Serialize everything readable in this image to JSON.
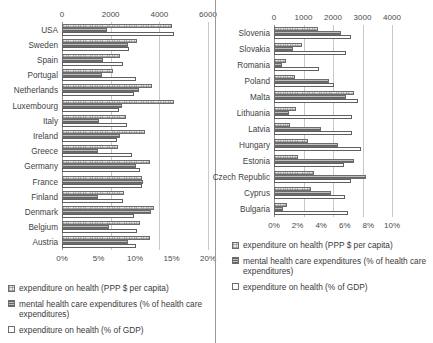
{
  "chart_data": [
    {
      "id": "western",
      "type": "bar",
      "orientation": "horizontal",
      "title": "",
      "grid": true,
      "legend_position": "bottom",
      "top_axis": {
        "label": "expenditure on health (PPP $ per capita)",
        "ticks": [
          "0",
          "2000",
          "4000",
          "6000"
        ],
        "values": [
          0,
          2000,
          4000,
          6000
        ],
        "lim": [
          0,
          6000
        ]
      },
      "bottom_axis": {
        "label": "percent",
        "ticks": [
          "0%",
          "5%",
          "10%",
          "15%",
          "20%"
        ],
        "values": [
          0,
          5,
          10,
          15,
          20
        ],
        "lim": [
          0,
          20
        ]
      },
      "categories": [
        "USA",
        "Sweden",
        "Spain",
        "Portugal",
        "Netherlands",
        "Luxembourg",
        "Italy",
        "Ireland",
        "Greece",
        "Germany",
        "France",
        "Finland",
        "Denmark",
        "Belgium",
        "Austria"
      ],
      "series": [
        {
          "name": "expenditure on health (PPP $ per capita)",
          "axis": "top",
          "style": "s0",
          "values": [
            4500,
            3100,
            2400,
            2100,
            3700,
            4600,
            2650,
            3400,
            2300,
            3600,
            3300,
            2550,
            3800,
            3200,
            3600
          ]
        },
        {
          "name": "mental health care expenditures (% of health care expenditures)",
          "axis": "bottom",
          "style": "s1",
          "values": [
            6.2,
            9.0,
            5.6,
            5.5,
            10.6,
            8.2,
            5.0,
            7.9,
            4.9,
            10.1,
            11.1,
            4.9,
            12.2,
            6.5,
            9.0
          ]
        },
        {
          "name": "expenditure on health (% of GDP)",
          "axis": "bottom",
          "style": "s2",
          "values": [
            15.3,
            9.2,
            8.4,
            10.2,
            9.8,
            7.8,
            8.9,
            7.6,
            9.6,
            10.7,
            11.0,
            8.4,
            9.8,
            10.3,
            10.2
          ]
        }
      ]
    },
    {
      "id": "eastern",
      "type": "bar",
      "orientation": "horizontal",
      "title": "",
      "grid": true,
      "legend_position": "bottom",
      "top_axis": {
        "label": "expenditure on health (PPP $ per capita)",
        "ticks": [
          "0",
          "1000",
          "2000",
          "3000",
          "4000"
        ],
        "values": [
          0,
          1000,
          2000,
          3000,
          4000
        ],
        "lim": [
          0,
          4000
        ]
      },
      "bottom_axis": {
        "label": "percent",
        "ticks": [
          "0%",
          "2%",
          "4%",
          "6%",
          "8%",
          "10%"
        ],
        "values": [
          0,
          2,
          4,
          6,
          8,
          10
        ],
        "lim": [
          0,
          10
        ]
      },
      "categories": [
        "Slovenia",
        "Slovakia",
        "Romania",
        "Poland",
        "Malta",
        "Lithuania",
        "Latvia",
        "Hungary",
        "Estonia",
        "Czech Republic",
        "Cyprus",
        "Bulgaria"
      ],
      "series": [
        {
          "name": "expenditure on health (PPP $ per capita)",
          "axis": "top",
          "style": "s0",
          "values": [
            1500,
            950,
            400,
            700,
            2700,
            750,
            550,
            1150,
            800,
            1350,
            1250,
            450
          ]
        },
        {
          "name": "mental health care expenditures (% of health care expenditures)",
          "axis": "bottom",
          "style": "s1",
          "values": [
            5.7,
            1.6,
            0.7,
            4.7,
            6.1,
            1.3,
            4.0,
            5.4,
            6.8,
            7.8,
            4.8,
            0.8
          ]
        },
        {
          "name": "expenditure on health (% of GDP)",
          "axis": "bottom",
          "style": "s2",
          "values": [
            6.5,
            6.1,
            3.8,
            5.1,
            7.1,
            6.6,
            6.6,
            7.4,
            5.9,
            6.5,
            6.0,
            6.3
          ]
        }
      ]
    }
  ],
  "legend": {
    "items": [
      {
        "label": "expenditure on health (PPP $ per capita)",
        "style": "s0"
      },
      {
        "label": "mental health care expenditures (% of health care expenditures)",
        "style": "s1"
      },
      {
        "label": "expenditure on health (% of GDP)",
        "style": "s2"
      }
    ]
  }
}
